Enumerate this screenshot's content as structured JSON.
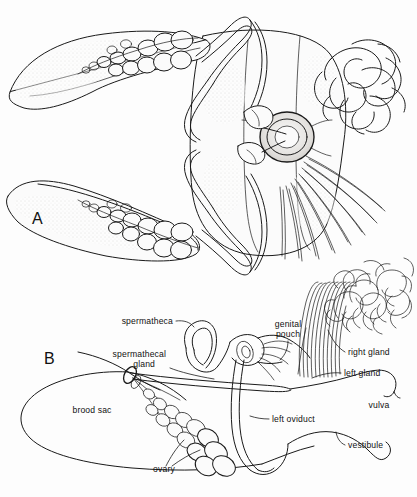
{
  "figure": {
    "panels": [
      {
        "id": "A",
        "letter": "A",
        "description": "Stippled dorsal view of whole reproductive system with paired ovaries, oviducts, spermathecae, genital pouch, coiled right gland and fanned left gland filaments",
        "labels": []
      },
      {
        "id": "B",
        "letter": "B",
        "description": "Line diagram of female reproductive tract",
        "labels": [
          {
            "key": "spermatheca",
            "text": "spermatheca",
            "x": 173,
            "y": 324,
            "anchor": "end"
          },
          {
            "key": "spermathecal_gland",
            "text": "spermathecal",
            "x": 166,
            "y": 357,
            "anchor": "end"
          },
          {
            "key": "spermathecal_gland2",
            "text": "gland",
            "x": 155,
            "y": 367,
            "anchor": "end"
          },
          {
            "key": "genital_pouch",
            "text": "genital",
            "x": 288,
            "y": 327,
            "anchor": "middle"
          },
          {
            "key": "genital_pouch2",
            "text": "pouch",
            "x": 288,
            "y": 337,
            "anchor": "middle"
          },
          {
            "key": "right_gland",
            "text": "right gland",
            "x": 348,
            "y": 355,
            "anchor": "start"
          },
          {
            "key": "left_gland",
            "text": "left gland",
            "x": 344,
            "y": 376,
            "anchor": "start"
          },
          {
            "key": "vulva",
            "text": "vulva",
            "x": 379,
            "y": 408,
            "anchor": "middle"
          },
          {
            "key": "left_oviduct",
            "text": "left oviduct",
            "x": 272,
            "y": 422,
            "anchor": "start"
          },
          {
            "key": "vestibule",
            "text": "vestibule",
            "x": 348,
            "y": 448,
            "anchor": "start"
          },
          {
            "key": "brood_sac",
            "text": "brood sac",
            "x": 92,
            "y": 413,
            "anchor": "middle"
          },
          {
            "key": "ovary",
            "text": "ovary",
            "x": 164,
            "y": 472,
            "anchor": "middle"
          }
        ]
      }
    ],
    "caption": "",
    "colors": {
      "ink": "#1a1a1a",
      "background": "#fdfdfd",
      "tone_light": "#f3f2f0",
      "tone_mid": "#e8e6e4",
      "tone_dark": "#d0cdc9"
    }
  }
}
